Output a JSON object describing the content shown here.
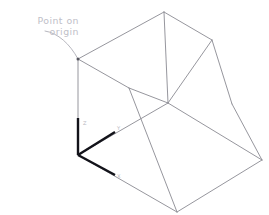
{
  "canvas": {
    "width": 269,
    "height": 215,
    "background": "#ffffff",
    "title": "Isometric wireframe solid with origin callout"
  },
  "annotation": {
    "name": "point-on-origin-callout",
    "line1": "Point  on",
    "line2": "origin",
    "color": "#c0c0c8",
    "leader_target": "top-left-vertex"
  },
  "axis_triad": {
    "name": "origin-axis-triad",
    "color": "#13131a",
    "origin": {
      "x": 78,
      "y": 155
    },
    "arms": [
      {
        "label": "Z",
        "name": "axis-arm-z",
        "to": {
          "x": 78,
          "y": 118
        },
        "label_pos": {
          "x": 83,
          "y": 125
        }
      },
      {
        "label": "Y",
        "name": "axis-arm-y",
        "to": {
          "x": 115,
          "y": 132
        },
        "label_pos": {
          "x": 117,
          "y": 130
        }
      },
      {
        "label": "X",
        "name": "axis-arm-x",
        "to": {
          "x": 115,
          "y": 175
        },
        "label_pos": {
          "x": 117,
          "y": 178
        }
      }
    ]
  },
  "geometry": {
    "name": "wireframe-solid",
    "stroke": "#8a8a92",
    "vertices": {
      "top_left": {
        "x": 78,
        "y": 59
      },
      "top_apex": {
        "x": 164,
        "y": 12
      },
      "top_right": {
        "x": 212,
        "y": 40
      },
      "top_front": {
        "x": 129,
        "y": 88
      },
      "mid_front": {
        "x": 168,
        "y": 103
      },
      "left_lower": {
        "x": 78,
        "y": 155
      },
      "bottom_front": {
        "x": 177,
        "y": 212
      },
      "bottom_right": {
        "x": 262,
        "y": 160
      },
      "right_lower": {
        "x": 232,
        "y": 104
      }
    },
    "edges": [
      {
        "name": "edge-top-left-to-apex",
        "from": "top_left",
        "to": "top_apex"
      },
      {
        "name": "edge-apex-to-top-right",
        "from": "top_apex",
        "to": "top_right"
      },
      {
        "name": "edge-top-right-to-mid-front",
        "from": "top_right",
        "to": "mid_front"
      },
      {
        "name": "edge-mid-front-to-top-front",
        "from": "mid_front",
        "to": "top_front"
      },
      {
        "name": "edge-top-front-to-top-left",
        "from": "top_front",
        "to": "top_left"
      },
      {
        "name": "edge-apex-to-mid-front",
        "from": "top_apex",
        "to": "mid_front"
      },
      {
        "name": "edge-top-left-vertical",
        "from": "top_left",
        "to": "left_lower"
      },
      {
        "name": "edge-top-front-to-bottom-front",
        "from": "top_front",
        "to": "bottom_front"
      },
      {
        "name": "edge-left-lower-to-bottom-front",
        "from": "left_lower",
        "to": "bottom_front"
      },
      {
        "name": "edge-bottom-front-to-bottom-right",
        "from": "bottom_front",
        "to": "bottom_right"
      },
      {
        "name": "edge-mid-front-to-bottom-right",
        "from": "mid_front",
        "to": "bottom_right"
      },
      {
        "name": "edge-left-lower-to-mid-front",
        "from": "left_lower",
        "to": "mid_front"
      },
      {
        "name": "edge-top-right-to-right-lower",
        "from": "top_right",
        "to": "right_lower"
      },
      {
        "name": "edge-right-lower-to-bottom-right",
        "from": "right_lower",
        "to": "bottom_right"
      }
    ]
  }
}
